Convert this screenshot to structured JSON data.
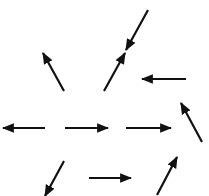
{
  "diagram": {
    "type": "vector-field-arrows",
    "background": "#ffffff",
    "stroke_color": "#111111",
    "stroke_width": 2.2,
    "arrows": [
      {
        "id": "arrow-1",
        "from": [
          64,
          91
        ],
        "to": [
          43,
          53
        ]
      },
      {
        "id": "arrow-2",
        "from": [
          148,
          10
        ],
        "to": [
          126,
          50
        ]
      },
      {
        "id": "arrow-3",
        "from": [
          104,
          91
        ],
        "to": [
          125,
          53
        ]
      },
      {
        "id": "arrow-4",
        "from": [
          186,
          79
        ],
        "to": [
          142,
          79
        ]
      },
      {
        "id": "arrow-5",
        "from": [
          45,
          128
        ],
        "to": [
          3,
          128
        ]
      },
      {
        "id": "arrow-6",
        "from": [
          65,
          128
        ],
        "to": [
          108,
          128
        ]
      },
      {
        "id": "arrow-7",
        "from": [
          126,
          128
        ],
        "to": [
          171,
          128
        ]
      },
      {
        "id": "arrow-8",
        "from": [
          202,
          142
        ],
        "to": [
          181,
          103
        ]
      },
      {
        "id": "arrow-9",
        "from": [
          64,
          161
        ],
        "to": [
          45,
          196
        ]
      },
      {
        "id": "arrow-10",
        "from": [
          89,
          178
        ],
        "to": [
          131,
          178
        ]
      },
      {
        "id": "arrow-11",
        "from": [
          157,
          195
        ],
        "to": [
          177,
          157
        ]
      }
    ]
  }
}
